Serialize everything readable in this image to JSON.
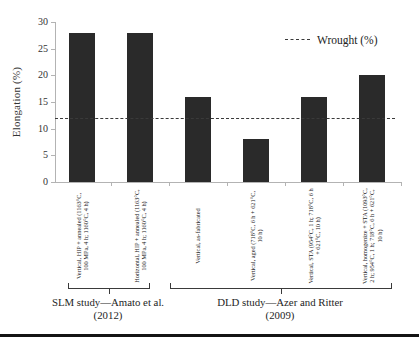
{
  "chart_data": {
    "type": "bar",
    "title": "",
    "xlabel": "",
    "ylabel": "Elongation (%)",
    "ylim": [
      0,
      30
    ],
    "yticks": [
      0,
      5,
      10,
      15,
      20,
      25,
      30
    ],
    "grid": false,
    "bar_color": "#2a2a2a",
    "legend_position": "top-right",
    "categories": [
      "Vertical, HIP + annealed (1163°C, 100 MPa, 4 h; 1160°C, 4 h)",
      "Horizontal, HIP + annealed (1163°C, 100 MPa, 4 h; 1160°C, 4 h)",
      "Vertical, as-fabricated",
      "Vertical, aged (718°C, 6 h + 621°C, 10 h)",
      "Vertical, STA (954°C, 1 h; 718°C, 6 h + 621°C, 10 h)",
      "Vertical, homogenize + STA (1093°C, 2 h; 954°C, 1 h; 718°C, 6 h + 621°C, 10 h)"
    ],
    "values": [
      28,
      28,
      16,
      8,
      16,
      20
    ],
    "reference_line": {
      "label": "Wrought (%)",
      "value": 12,
      "style": "dashed"
    },
    "groups": [
      {
        "line1": "SLM study—Amato et al.",
        "line2": "(2012)",
        "first_bar": 0,
        "last_bar": 1
      },
      {
        "line1": "DLD study—Azer and Ritter",
        "line2": "(2009)",
        "first_bar": 2,
        "last_bar": 5
      }
    ]
  }
}
